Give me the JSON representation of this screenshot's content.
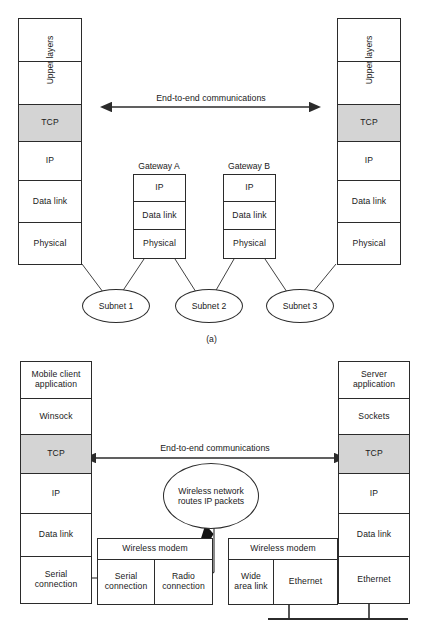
{
  "figure": {
    "caption_a": "(a)",
    "arrow_label_top": "End-to-end communications",
    "arrow_label_bottom": "End-to-end communications"
  },
  "diagram_a": {
    "title": "(a)",
    "left_stack": {
      "name": "host-stack-left",
      "cells": [
        {
          "label": "",
          "shaded": false
        },
        {
          "label": "",
          "shaded": false
        },
        {
          "label": "TCP",
          "shaded": true
        },
        {
          "label": "IP",
          "shaded": false
        },
        {
          "label": "Data link",
          "shaded": false
        },
        {
          "label": "Physical",
          "shaded": false
        }
      ],
      "vertical_label": "Upper layers"
    },
    "right_stack": {
      "name": "host-stack-right",
      "cells": [
        {
          "label": "",
          "shaded": false
        },
        {
          "label": "",
          "shaded": false
        },
        {
          "label": "TCP",
          "shaded": true
        },
        {
          "label": "IP",
          "shaded": false
        },
        {
          "label": "Data link",
          "shaded": false
        },
        {
          "label": "Physical",
          "shaded": false
        }
      ],
      "vertical_label": "Upper layers"
    },
    "gateways": [
      {
        "title": "Gateway A",
        "cells": [
          "IP",
          "Data link",
          "Physical"
        ]
      },
      {
        "title": "Gateway B",
        "cells": [
          "IP",
          "Data link",
          "Physical"
        ]
      }
    ],
    "subnets": [
      "Subnet 1",
      "Subnet 2",
      "Subnet 3"
    ]
  },
  "diagram_b": {
    "left_stack": {
      "name": "mobile-client-stack",
      "cells": [
        {
          "label": "Mobile client application",
          "shaded": false
        },
        {
          "label": "Winsock",
          "shaded": false
        },
        {
          "label": "TCP",
          "shaded": true
        },
        {
          "label": "IP",
          "shaded": false
        },
        {
          "label": "Data link",
          "shaded": false
        },
        {
          "label": "Serial connection",
          "shaded": false
        }
      ]
    },
    "right_stack": {
      "name": "server-stack",
      "cells": [
        {
          "label": "Server application",
          "shaded": false
        },
        {
          "label": "Sockets",
          "shaded": false
        },
        {
          "label": "TCP",
          "shaded": true
        },
        {
          "label": "IP",
          "shaded": false
        },
        {
          "label": "Data link",
          "shaded": false
        },
        {
          "label": "Ethernet",
          "shaded": false
        }
      ]
    },
    "cloud": {
      "line1": "Wireless network",
      "line2": "routes IP packets"
    },
    "modem_left": {
      "title": "Wireless modem",
      "cells": [
        "Serial connection",
        "Radio connection"
      ]
    },
    "modem_right": {
      "title": "Wireless modem",
      "cells": [
        "Wide area link",
        "Ethernet"
      ]
    }
  },
  "colors": {
    "stroke": "#2b2b2b",
    "shade": "#d4d4d4",
    "background": "#ffffff"
  }
}
